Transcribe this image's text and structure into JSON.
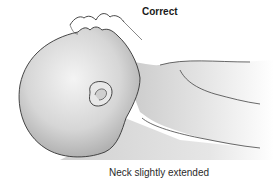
{
  "figure": {
    "title": "Correct",
    "caption": "Neck slightly extended"
  },
  "colors": {
    "outline": "#333333",
    "skin_light": "#f2f2f2",
    "skin_shade": "#b8b8b8",
    "surface": "#d9d9d9",
    "background": "#ffffff"
  }
}
